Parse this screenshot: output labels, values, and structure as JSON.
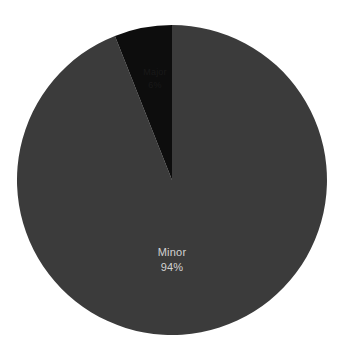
{
  "chart_data": {
    "type": "pie",
    "title": "",
    "subtitle": "",
    "xlabel": "",
    "ylabel": "",
    "grid": false,
    "legend_position": "none",
    "background_color": "#ffffff",
    "start_angle_deg": 0,
    "direction": "clockwise",
    "center": {
      "x": 172,
      "y": 180
    },
    "radius": 155,
    "categories": [
      "Minor",
      "Major"
    ],
    "values": [
      94,
      6
    ],
    "value_unit": "percent",
    "colors": [
      "#3b3b3b",
      "#0d0d0d"
    ],
    "slices": [
      {
        "name": "Minor",
        "label": "Minor",
        "value": 94,
        "percent_label": "94%",
        "color": "#3b3b3b",
        "label_color": "#d2d2d2",
        "label_x": 172,
        "label_y": 253,
        "percent_x": 172,
        "percent_y": 268,
        "start_angle_deg": 0,
        "end_angle_deg": 338.4,
        "label_visible": true
      },
      {
        "name": "Major",
        "label": "Major",
        "value": 6,
        "percent_label": "6%",
        "color": "#0d0d0d",
        "label_color": "#191919",
        "label_x": 155,
        "label_y": 73,
        "percent_x": 155,
        "percent_y": 86,
        "start_angle_deg": 338.4,
        "end_angle_deg": 360,
        "label_visible": true
      }
    ]
  },
  "geometry": {
    "slice_minor_path": "M 172 180 L 172 25 A 155 155 0 1 1 114.95 23.06 Z",
    "slice_major_path": "M 172 180 L 114.95 23.06 A 155 155 0 0 1 172 25 Z"
  }
}
